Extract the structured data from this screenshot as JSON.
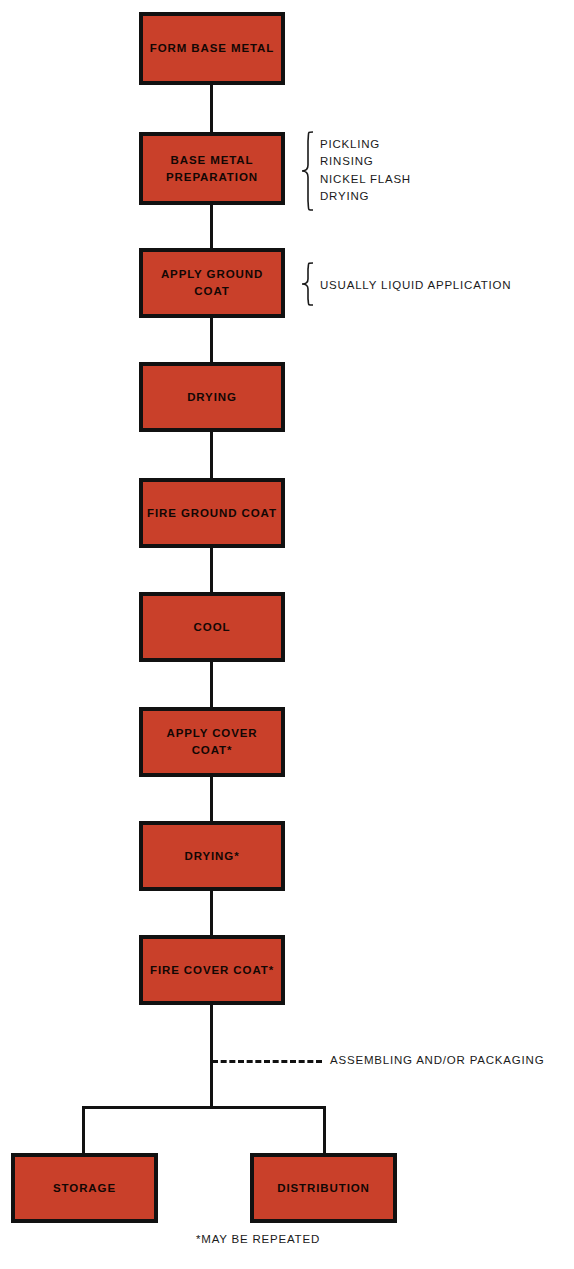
{
  "diagram": {
    "accent_color": "#C9402A",
    "line_color": "#111111",
    "background_color": "#FFFFFF",
    "nodes": [
      {
        "id": "form-base-metal",
        "label": "FORM BASE METAL"
      },
      {
        "id": "base-metal-preparation",
        "label": "BASE METAL\nPREPARATION"
      },
      {
        "id": "apply-ground-coat",
        "label": "APPLY GROUND COAT"
      },
      {
        "id": "drying",
        "label": "DRYING"
      },
      {
        "id": "fire-ground-coat",
        "label": "FIRE GROUND COAT"
      },
      {
        "id": "cool",
        "label": "COOL"
      },
      {
        "id": "apply-cover-coat",
        "label": "APPLY COVER COAT*"
      },
      {
        "id": "drying-star",
        "label": "DRYING*"
      },
      {
        "id": "fire-cover-coat",
        "label": "FIRE COVER COAT*"
      },
      {
        "id": "storage",
        "label": "STORAGE"
      },
      {
        "id": "distribution",
        "label": "DISTRIBUTION"
      }
    ],
    "annotations": {
      "base_metal_steps": "PICKLING\nRINSING\nNICKEL FLASH\nDRYING",
      "ground_coat_note": "USUALLY LIQUID APPLICATION",
      "assembling_note": "ASSEMBLING AND/OR PACKAGING"
    },
    "footnote": "*MAY BE REPEATED"
  }
}
